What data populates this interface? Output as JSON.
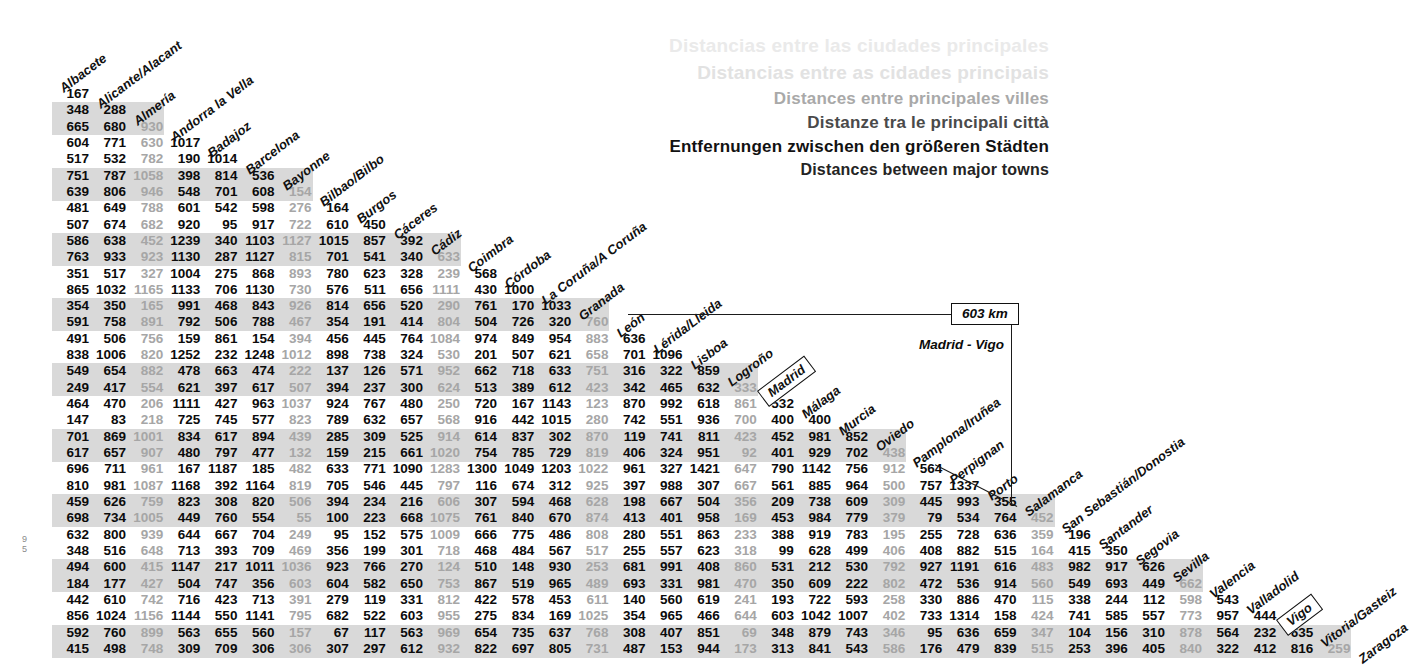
{
  "titles": {
    "lines": [
      "Distancias entre las ciudades principales",
      "Distancias entre as cidades principais",
      "Distances entre principales villes",
      "Distanze tra le principali città",
      "Entfernungen zwischen den größeren Städten",
      "Distances between major towns"
    ]
  },
  "callout": {
    "km_label": "603 km",
    "pair_label": "Madrid - Vigo",
    "highlighted_cities": [
      "Madrid",
      "Vigo"
    ]
  },
  "page_mark": "9\n5",
  "colors": {
    "band": "#d9d9d9",
    "text": "#0b0b0b",
    "faint_text": "#a6a6a6",
    "rule": "#1b1b1b"
  },
  "chart_data": {
    "type": "table",
    "title": "Distances between major towns",
    "subtitle": "Distancias entre las ciudades principales",
    "units": "km",
    "shape": "lower-triangular distance matrix",
    "cities": [
      "Albacete",
      "Alicante/Alacant",
      "Almería",
      "Andorra la Vella",
      "Badajoz",
      "Barcelona",
      "Bayonne",
      "Bilbao/Bilbo",
      "Burgos",
      "Cáceres",
      "Cádiz",
      "Coimbra",
      "Córdoba",
      "La Coruña/A Coruña",
      "Granada",
      "León",
      "Lérida/Lleida",
      "Lisboa",
      "Logroño",
      "Madrid",
      "Málaga",
      "Murcia",
      "Oviedo",
      "Pamplona/Iruñea",
      "Perpignan",
      "Porto",
      "Salamanca",
      "San Sebastián/Donostia",
      "Santander",
      "Segovia",
      "Sevilla",
      "Valencia",
      "Valladolid",
      "Vigo",
      "Vitoria/Gasteiz",
      "Zaragoza"
    ],
    "rows": [
      [
        167
      ],
      [
        348,
        288
      ],
      [
        665,
        680,
        930
      ],
      [
        604,
        771,
        630,
        1017
      ],
      [
        517,
        532,
        782,
        190,
        1014
      ],
      [
        751,
        787,
        1058,
        398,
        814,
        536
      ],
      [
        639,
        806,
        946,
        548,
        701,
        608,
        154
      ],
      [
        481,
        649,
        788,
        601,
        542,
        598,
        276,
        164
      ],
      [
        507,
        674,
        682,
        920,
        95,
        917,
        722,
        610,
        450
      ],
      [
        586,
        638,
        452,
        1239,
        340,
        1103,
        1127,
        1015,
        857,
        392
      ],
      [
        763,
        933,
        923,
        1130,
        287,
        1127,
        815,
        701,
        541,
        340,
        633
      ],
      [
        351,
        517,
        327,
        1004,
        275,
        868,
        893,
        780,
        623,
        328,
        239,
        568
      ],
      [
        865,
        1032,
        1165,
        1133,
        706,
        1130,
        730,
        576,
        511,
        656,
        1111,
        430,
        1000
      ],
      [
        354,
        350,
        165,
        991,
        468,
        843,
        926,
        814,
        656,
        520,
        290,
        761,
        170,
        1033
      ],
      [
        591,
        758,
        891,
        792,
        506,
        788,
        467,
        354,
        191,
        414,
        804,
        504,
        726,
        320,
        760
      ],
      [
        491,
        506,
        756,
        159,
        861,
        154,
        394,
        456,
        445,
        764,
        1084,
        974,
        849,
        954,
        883,
        636
      ],
      [
        838,
        1006,
        820,
        1252,
        232,
        1248,
        1012,
        898,
        738,
        324,
        530,
        201,
        507,
        621,
        658,
        701,
        1096
      ],
      [
        549,
        654,
        882,
        478,
        663,
        474,
        222,
        137,
        126,
        571,
        952,
        662,
        718,
        633,
        751,
        316,
        322,
        859
      ],
      [
        249,
        417,
        554,
        621,
        397,
        617,
        507,
        394,
        237,
        300,
        624,
        513,
        389,
        612,
        423,
        342,
        465,
        632,
        333
      ],
      [
        464,
        470,
        206,
        1111,
        427,
        963,
        1037,
        924,
        767,
        480,
        250,
        720,
        167,
        1143,
        123,
        870,
        992,
        618,
        861,
        532
      ],
      [
        147,
        83,
        218,
        725,
        745,
        577,
        823,
        789,
        632,
        657,
        568,
        916,
        442,
        1015,
        280,
        742,
        551,
        936,
        700,
        400,
        400
      ],
      [
        701,
        869,
        1001,
        834,
        617,
        894,
        439,
        285,
        309,
        525,
        914,
        614,
        837,
        302,
        870,
        119,
        741,
        811,
        423,
        452,
        981,
        852
      ],
      [
        617,
        657,
        907,
        480,
        797,
        477,
        132,
        159,
        215,
        661,
        1020,
        754,
        785,
        729,
        819,
        406,
        324,
        951,
        92,
        401,
        929,
        702,
        438
      ],
      [
        696,
        711,
        961,
        167,
        1187,
        185,
        482,
        633,
        771,
        1090,
        1283,
        1300,
        1049,
        1203,
        1022,
        961,
        327,
        1421,
        647,
        790,
        1142,
        756,
        912,
        564
      ],
      [
        810,
        981,
        1087,
        1168,
        392,
        1164,
        819,
        705,
        546,
        445,
        797,
        116,
        674,
        312,
        925,
        397,
        988,
        307,
        667,
        561,
        885,
        964,
        500,
        757,
        1337
      ],
      [
        459,
        626,
        759,
        823,
        308,
        820,
        506,
        394,
        234,
        216,
        606,
        307,
        594,
        468,
        628,
        198,
        667,
        504,
        356,
        209,
        738,
        609,
        309,
        445,
        993,
        355
      ],
      [
        698,
        734,
        1005,
        449,
        760,
        554,
        55,
        100,
        223,
        668,
        1075,
        761,
        840,
        670,
        874,
        413,
        401,
        958,
        169,
        453,
        984,
        779,
        379,
        79,
        534,
        764,
        452
      ],
      [
        632,
        800,
        939,
        644,
        667,
        704,
        249,
        95,
        152,
        575,
        1009,
        666,
        775,
        486,
        808,
        280,
        551,
        863,
        233,
        388,
        919,
        783,
        195,
        255,
        728,
        636,
        359,
        196
      ],
      [
        348,
        516,
        648,
        713,
        393,
        709,
        469,
        356,
        199,
        301,
        718,
        468,
        484,
        567,
        517,
        255,
        557,
        623,
        318,
        99,
        628,
        499,
        406,
        408,
        882,
        515,
        164,
        415,
        350
      ],
      [
        494,
        600,
        415,
        1147,
        217,
        1011,
        1036,
        923,
        766,
        270,
        124,
        510,
        148,
        930,
        253,
        681,
        991,
        408,
        860,
        531,
        212,
        530,
        792,
        927,
        1191,
        616,
        483,
        982,
        917,
        626
      ],
      [
        184,
        177,
        427,
        504,
        747,
        356,
        603,
        604,
        582,
        650,
        753,
        867,
        519,
        965,
        489,
        693,
        331,
        981,
        470,
        350,
        609,
        222,
        802,
        472,
        536,
        914,
        560,
        549,
        693,
        449,
        662
      ],
      [
        442,
        610,
        742,
        716,
        423,
        713,
        391,
        279,
        119,
        331,
        812,
        422,
        578,
        453,
        611,
        140,
        560,
        619,
        241,
        193,
        722,
        593,
        258,
        330,
        886,
        470,
        115,
        338,
        244,
        112,
        598,
        543
      ],
      [
        856,
        1024,
        1156,
        1144,
        550,
        1141,
        795,
        682,
        522,
        603,
        955,
        275,
        834,
        169,
        1025,
        354,
        965,
        466,
        644,
        603,
        1042,
        1007,
        402,
        733,
        1314,
        158,
        424,
        741,
        585,
        557,
        773,
        957,
        444
      ],
      [
        592,
        760,
        899,
        563,
        655,
        560,
        157,
        67,
        117,
        563,
        969,
        654,
        735,
        637,
        768,
        308,
        407,
        851,
        69,
        348,
        879,
        743,
        346,
        95,
        636,
        659,
        347,
        104,
        156,
        310,
        878,
        564,
        232,
        635
      ],
      [
        415,
        498,
        748,
        309,
        709,
        306,
        306,
        307,
        297,
        612,
        932,
        822,
        697,
        805,
        731,
        487,
        153,
        944,
        173,
        313,
        841,
        543,
        586,
        176,
        479,
        839,
        515,
        253,
        396,
        405,
        840,
        322,
        412,
        816,
        259
      ]
    ]
  }
}
